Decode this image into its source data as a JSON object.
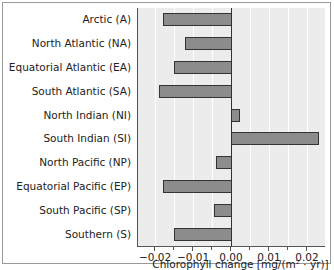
{
  "chart_data": {
    "type": "bar",
    "orientation": "horizontal",
    "title": "",
    "xlabel": "Chlorophyll change [mg/(m² · yr)]",
    "ylabel": "",
    "xlim": [
      -0.0215,
      0.025
    ],
    "xticks": [
      -0.02,
      -0.01,
      0.0,
      0.01,
      0.02
    ],
    "xtick_labels": [
      "−0.02",
      "−0.01",
      "0.00",
      "0.01",
      "0.02"
    ],
    "grid": "vertical",
    "categories": [
      "Arctic (A)",
      "North Atlantic (NA)",
      "Equatorial Atlantic (EA)",
      "South Atlantic (SA)",
      "North Indian (NI)",
      "South Indian (SI)",
      "North Pacific (NP)",
      "Equatorial Pacific (EP)",
      "South Pacific (SP)",
      "Southern (S)"
    ],
    "values": [
      -0.018,
      -0.012,
      -0.015,
      -0.019,
      0.002,
      0.023,
      -0.004,
      -0.018,
      -0.0045,
      -0.015
    ]
  },
  "colors": {
    "bar": "#8c8c8c",
    "plot_bg": "#ececec",
    "grid": "#ffffff"
  }
}
